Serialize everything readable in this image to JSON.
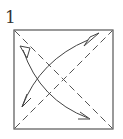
{
  "diagram": {
    "type": "origami-step",
    "step_number": "1",
    "elements": [
      {
        "kind": "square-paper",
        "description": "square sheet outline"
      },
      {
        "kind": "valley-fold-line",
        "description": "dashed diagonal from top-left to bottom-right"
      },
      {
        "kind": "valley-fold-line",
        "description": "dashed diagonal from bottom-left to top-right"
      },
      {
        "kind": "fold-unfold-arrow",
        "description": "curved arrow from bottom-left to top-right, open arrowheads both ends"
      },
      {
        "kind": "fold-unfold-arrow",
        "description": "curved arrow from top-left to bottom-right, open arrowheads both ends"
      }
    ],
    "colors": {
      "line": "#444444",
      "background": "#ffffff"
    }
  }
}
